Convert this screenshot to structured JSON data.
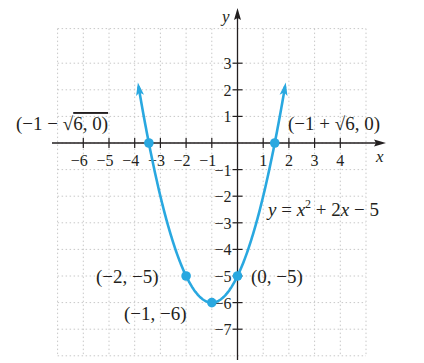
{
  "chart_data": {
    "type": "line",
    "title": "",
    "equation_label": "y = x² + 2x − 5",
    "xlabel": "x",
    "ylabel": "y",
    "xlim": [
      -7,
      5
    ],
    "ylim": [
      -8,
      4
    ],
    "grid": true,
    "x_ticks": [
      "−6",
      "−5",
      "−4",
      "−3",
      "−2",
      "−1",
      "1",
      "2",
      "3",
      "4"
    ],
    "y_ticks": [
      "3",
      "2",
      "1",
      "−1",
      "−2",
      "−3",
      "−4",
      "−5",
      "−6",
      "−7"
    ],
    "series": [
      {
        "name": "y = x^2 + 2x - 5",
        "function": "x^2 + 2x - 5",
        "color": "#29a8e0",
        "x": [
          -3.9,
          -3.449,
          -3,
          -2,
          -1,
          0,
          1,
          1.449,
          1.9
        ],
        "y": [
          2.41,
          0,
          -2,
          -5,
          -6,
          -5,
          -2,
          0,
          2.41
        ]
      }
    ],
    "highlighted_points": [
      {
        "label": "(−1 − √6, 0)",
        "x": -3.449,
        "y": 0
      },
      {
        "label": "(−1 + √6, 0)",
        "x": 1.449,
        "y": 0
      },
      {
        "label": "(−2, −5)",
        "x": -2,
        "y": -5
      },
      {
        "label": "(−1, −6)",
        "x": -1,
        "y": -6
      },
      {
        "label": "(0, −5)",
        "x": 0,
        "y": -5
      }
    ]
  },
  "labels": {
    "eq_y": "y",
    "eq_eq": " = ",
    "eq_x": "x",
    "eq_sup": "2",
    "eq_rest1": " + 2",
    "eq_x2": "x",
    "eq_rest2": " − 5",
    "left_root_a": "(−1 − ",
    "left_root_b": "6, 0)",
    "right_root_a": "(−1 + ",
    "right_root_b": "6, 0)",
    "pt_m2m5": "(−2, −5)",
    "pt_m1m6": "(−1, −6)",
    "pt_0m5": "(0, −5)",
    "sqrt": "√"
  },
  "colors": {
    "curve": "#29a8e0",
    "axis": "#231f20",
    "grid": "#c8c8c8"
  }
}
